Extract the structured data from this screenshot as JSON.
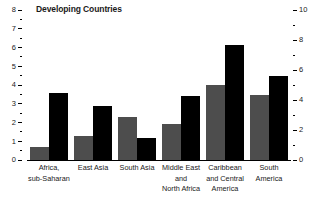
{
  "chart_data": {
    "type": "bar",
    "title": "Developing Countries",
    "subtitle": "",
    "xlabel": "",
    "ylabel": "",
    "grid": false,
    "legend": "none",
    "categories": [
      "Africa,\nsub-Saharan",
      "East Asia",
      "South Asia",
      "Middle East\nand\nNorth Africa",
      "Caribbean\nand Central\nAmerica",
      "South\nAmerica"
    ],
    "series": [
      {
        "name": "gray-series",
        "axis": "left",
        "color": "#4d4d4d",
        "values": [
          0.7,
          1.3,
          2.3,
          1.9,
          4.0,
          3.45
        ]
      },
      {
        "name": "black-series",
        "axis": "right",
        "color": "#000000",
        "values": [
          4.5,
          3.6,
          1.5,
          4.3,
          7.7,
          5.6
        ]
      }
    ],
    "left_axis": {
      "ylim": [
        0,
        8
      ],
      "major_ticks": [
        0,
        1,
        2,
        3,
        4,
        5,
        6,
        7,
        8
      ],
      "major_tick_labels": [
        "0",
        "1",
        "2",
        "3",
        "4",
        "5",
        "6",
        "7",
        "8"
      ],
      "minor_ticks": [
        0.5,
        1.5,
        2.5,
        3.5,
        4.5,
        5.5,
        6.5,
        7.5
      ]
    },
    "right_axis": {
      "ylim": [
        0,
        10
      ],
      "major_ticks": [
        0,
        2,
        4,
        6,
        8,
        10
      ],
      "major_tick_labels": [
        "0",
        "2",
        "4",
        "6",
        "8",
        "10"
      ],
      "minor_ticks": [
        1,
        3,
        5,
        7,
        9
      ]
    }
  }
}
